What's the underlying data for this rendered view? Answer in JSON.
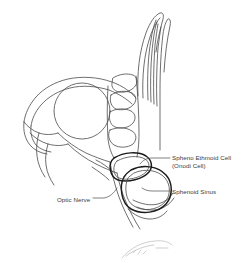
{
  "figure": {
    "kind": "medical-line-drawing",
    "background_color": "#ffffff",
    "line_color": "#4a4a4a",
    "emphasis_line_color": "#1c1c1c",
    "signature_color": "#b9b9b9"
  },
  "labels": {
    "onodi_line1": "Spheno Ethmoid Cell",
    "onodi_line2": "(Onodi Cell)",
    "sphenoid_sinus": "Sphenoid Sinus",
    "optic_nerve": "Optic Nerve"
  }
}
